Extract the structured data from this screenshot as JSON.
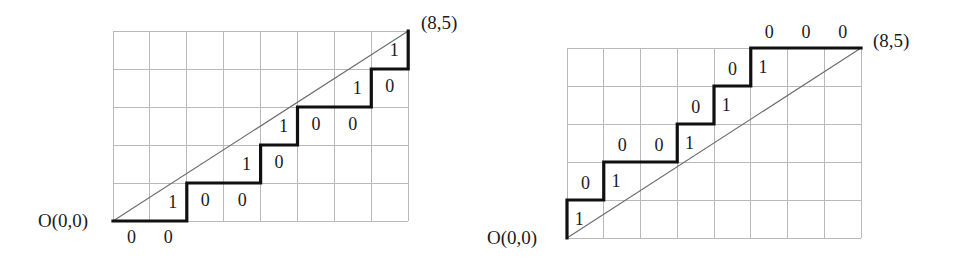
{
  "figure": {
    "grid_line_color": "#b9b9b9",
    "path_color": "#101010",
    "diagonal_color": "#6b6b6b",
    "background_color": "#ffffff"
  },
  "chart_data": {
    "type": "line",
    "xlabel": "",
    "ylabel": "",
    "xlim": [
      0,
      8
    ],
    "ylim": [
      0,
      5
    ],
    "grid": true,
    "legend": "none",
    "panels": [
      {
        "name": "left-panel",
        "origin_label": "O(0,0)",
        "endpoint_label": "(8,5)",
        "grid_cols": 8,
        "grid_rows": 5,
        "diagonal": {
          "from": [
            0,
            0
          ],
          "to": [
            8,
            5
          ]
        },
        "path_vertices": [
          [
            0,
            0
          ],
          [
            2,
            0
          ],
          [
            2,
            1
          ],
          [
            4,
            1
          ],
          [
            4,
            2
          ],
          [
            5,
            2
          ],
          [
            5,
            3
          ],
          [
            7,
            3
          ],
          [
            7,
            4
          ],
          [
            8,
            4
          ],
          [
            8,
            5
          ]
        ],
        "step_sequence": [
          "R",
          "R",
          "U",
          "R",
          "R",
          "U",
          "R",
          "U",
          "R",
          "R",
          "U",
          "R",
          "U"
        ],
        "binary_word": "0010010100101",
        "step_labels": [
          {
            "text": "0",
            "x": 0.5,
            "y": -0.42
          },
          {
            "text": "0",
            "x": 1.5,
            "y": -0.42
          },
          {
            "text": "1",
            "x": 1.62,
            "y": 0.5
          },
          {
            "text": "0",
            "x": 2.5,
            "y": 0.55
          },
          {
            "text": "0",
            "x": 3.5,
            "y": 0.55
          },
          {
            "text": "1",
            "x": 3.62,
            "y": 1.5
          },
          {
            "text": "0",
            "x": 4.5,
            "y": 1.55
          },
          {
            "text": "1",
            "x": 4.62,
            "y": 2.5
          },
          {
            "text": "0",
            "x": 5.5,
            "y": 2.55
          },
          {
            "text": "0",
            "x": 6.5,
            "y": 2.55
          },
          {
            "text": "1",
            "x": 6.62,
            "y": 3.5
          },
          {
            "text": "0",
            "x": 7.5,
            "y": 3.55
          },
          {
            "text": "1",
            "x": 7.62,
            "y": 4.5
          }
        ]
      },
      {
        "name": "right-panel",
        "origin_label": "O(0,0)",
        "endpoint_label": "(8,5)",
        "grid_cols": 8,
        "grid_rows": 5,
        "diagonal": {
          "from": [
            0,
            0
          ],
          "to": [
            8,
            5
          ]
        },
        "path_vertices": [
          [
            0,
            0
          ],
          [
            0,
            1
          ],
          [
            1,
            1
          ],
          [
            1,
            2
          ],
          [
            3,
            2
          ],
          [
            3,
            3
          ],
          [
            4,
            3
          ],
          [
            4,
            4
          ],
          [
            5,
            4
          ],
          [
            5,
            5
          ],
          [
            8,
            5
          ]
        ],
        "step_sequence": [
          "U",
          "R",
          "U",
          "R",
          "R",
          "U",
          "R",
          "U",
          "R",
          "U",
          "R",
          "R",
          "R"
        ],
        "binary_word": "1010010101000",
        "step_labels": [
          {
            "text": "1",
            "x": 0.33,
            "y": 0.5
          },
          {
            "text": "0",
            "x": 0.5,
            "y": 1.45
          },
          {
            "text": "1",
            "x": 1.33,
            "y": 1.5
          },
          {
            "text": "0",
            "x": 1.5,
            "y": 2.45
          },
          {
            "text": "0",
            "x": 2.5,
            "y": 2.45
          },
          {
            "text": "1",
            "x": 3.33,
            "y": 2.5
          },
          {
            "text": "0",
            "x": 3.5,
            "y": 3.45
          },
          {
            "text": "1",
            "x": 4.33,
            "y": 3.5
          },
          {
            "text": "0",
            "x": 4.5,
            "y": 4.45
          },
          {
            "text": "1",
            "x": 5.33,
            "y": 4.5
          },
          {
            "text": "0",
            "x": 5.5,
            "y": 5.42
          },
          {
            "text": "0",
            "x": 6.5,
            "y": 5.42
          },
          {
            "text": "0",
            "x": 7.5,
            "y": 5.42
          }
        ]
      }
    ]
  }
}
